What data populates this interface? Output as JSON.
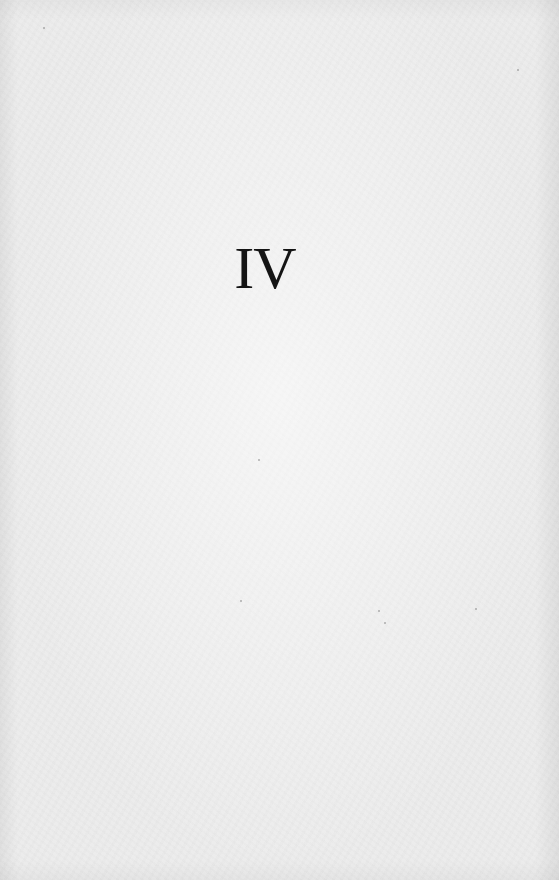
{
  "page": {
    "type": "part-divider",
    "part_number": "IV",
    "background_color": "#ececec",
    "text_color": "#141414"
  }
}
